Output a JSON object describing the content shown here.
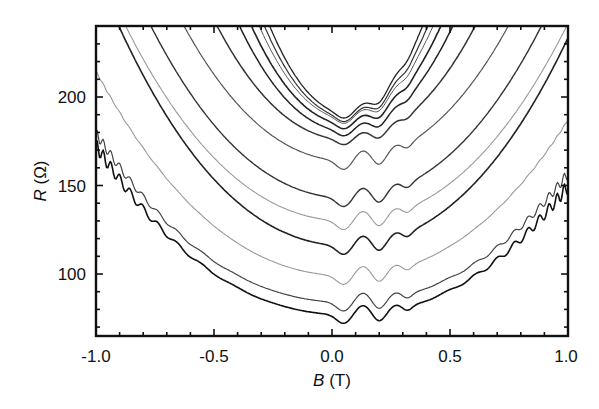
{
  "chart_data": {
    "type": "line",
    "title": "",
    "xlabel": "B (T)",
    "xlabel_var": "B",
    "xlabel_unit": " (T)",
    "ylabel": "R (Ω)",
    "ylabel_var": "R",
    "ylabel_unit": " (Ω)",
    "xlim": [
      -1.0,
      1.0
    ],
    "ylim": [
      64,
      240
    ],
    "x_ticks": [
      -1.0,
      -0.5,
      0.0,
      0.5,
      1.0
    ],
    "x_tick_labels": [
      "-1.0",
      "-0.5",
      "0.0",
      "0.5",
      "1.0"
    ],
    "y_ticks": [
      100,
      150,
      200
    ],
    "y_tick_labels": [
      "100",
      "150",
      "200"
    ],
    "grid": false,
    "legend": "none",
    "series": [
      {
        "name": "curve-1",
        "min_R": 191,
        "curvature": 420,
        "color": "#222222",
        "width": 1.3,
        "osc": 0
      },
      {
        "name": "curve-2",
        "min_R": 189,
        "curvature": 380,
        "color": "#333333",
        "width": 1.2,
        "osc": 0
      },
      {
        "name": "curve-3",
        "min_R": 188,
        "curvature": 340,
        "color": "#555555",
        "width": 1.0,
        "osc": 0
      },
      {
        "name": "curve-4",
        "min_R": 185,
        "curvature": 300,
        "color": "#222222",
        "width": 1.6,
        "osc": 0
      },
      {
        "name": "curve-5",
        "min_R": 181,
        "curvature": 250,
        "color": "#222222",
        "width": 1.5,
        "osc": 0
      },
      {
        "name": "curve-6",
        "min_R": 176,
        "curvature": 180,
        "color": "#333333",
        "width": 1.5,
        "osc": 0
      },
      {
        "name": "curve-7",
        "min_R": 164,
        "curvature": 130,
        "color": "#555555",
        "width": 1.2,
        "osc": 0
      },
      {
        "name": "curve-8",
        "min_R": 143,
        "curvature": 110,
        "color": "#333333",
        "width": 1.4,
        "osc": 0
      },
      {
        "name": "curve-9",
        "min_R": 130,
        "curvature": 95,
        "color": "#999999",
        "width": 1.1,
        "osc": 0
      },
      {
        "name": "curve-10",
        "min_R": 116,
        "curvature": 100,
        "color": "#222222",
        "width": 1.6,
        "osc": 0
      },
      {
        "name": "curve-11",
        "min_R": 99,
        "curvature": 75,
        "color": "#999999",
        "width": 1.1,
        "osc": 0.5
      },
      {
        "name": "curve-12",
        "min_R": 84,
        "curvature": 62,
        "color": "#444444",
        "width": 1.2,
        "osc": 3
      },
      {
        "name": "curve-13",
        "min_R": 77,
        "curvature": 62,
        "color": "#111111",
        "width": 1.6,
        "osc": 4
      }
    ],
    "dip_features_B": [
      0.05,
      0.13,
      0.2,
      0.28,
      0.32
    ]
  }
}
